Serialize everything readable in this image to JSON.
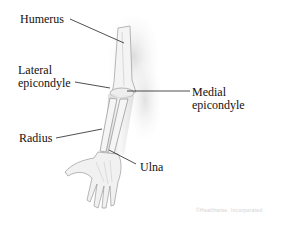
{
  "diagram": {
    "labels": {
      "humerus": "Humerus",
      "lateral_epicondyle": "Lateral\nepicondyle",
      "medial_epicondyle": "Medial\nepicondyle",
      "radius": "Radius",
      "ulna": "Ulna"
    },
    "watermark": "©Healthwise, Incorporated",
    "colors": {
      "label_text": "#111111",
      "leader_line": "#222222",
      "bone_shading": "#9a9a9a",
      "skin_shadow": "#d4d4d4"
    }
  }
}
